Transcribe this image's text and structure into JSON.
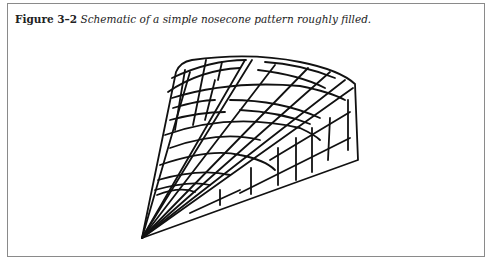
{
  "figure": {
    "label": "Figure 3–2",
    "caption": " Schematic of a simple nosecone pattern roughly filled.",
    "illustration": "nosecone-wireframe-drawing",
    "stroke_color": "#111111",
    "border_color": "#8a8a8a"
  }
}
